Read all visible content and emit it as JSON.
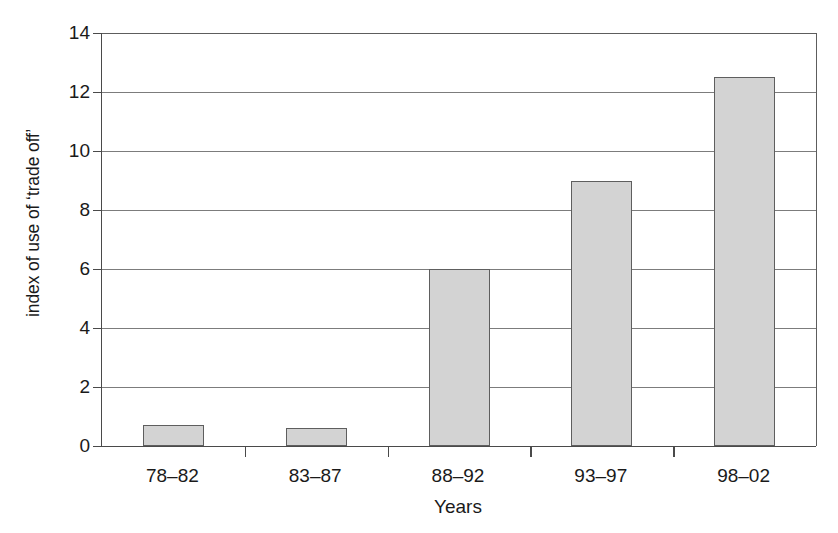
{
  "chart_data": {
    "type": "bar",
    "title": "",
    "xlabel": "Years",
    "ylabel": "index of use of ‘trade off’",
    "categories": [
      "78–82",
      "83–87",
      "88–92",
      "93–97",
      "98–02"
    ],
    "values": [
      0.7,
      0.6,
      6.0,
      9.0,
      12.5
    ],
    "ylim": [
      0,
      14
    ],
    "yticks": [
      0,
      2,
      4,
      6,
      8,
      10,
      12,
      14
    ],
    "ytick_labels": [
      "0",
      "2",
      "4",
      "6",
      "8",
      "10",
      "12",
      "14"
    ],
    "grid": "horizontal",
    "legend": "none",
    "series": [
      {
        "name": "index of use of ‘trade off’",
        "values": [
          0.7,
          0.6,
          6.0,
          9.0,
          12.5
        ]
      }
    ],
    "colors": {
      "bar_fill": "#d3d3d3",
      "bar_border": "#5e5e5e",
      "gridline": "#7c7c7c",
      "axis": "#4a4a4a",
      "text": "#1a1a1a",
      "background": "#ffffff"
    }
  }
}
